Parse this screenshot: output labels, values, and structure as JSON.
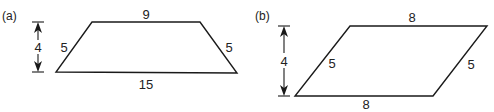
{
  "figures": [
    {
      "id": "a",
      "label": "(a)",
      "shape": "trapezoid",
      "sides": {
        "top": "9",
        "bottom": "15",
        "left": "5",
        "right": "5"
      },
      "height_label": "4"
    },
    {
      "id": "b",
      "label": "(b)",
      "shape": "parallelogram",
      "sides": {
        "top": "8",
        "bottom": "8",
        "left": "5",
        "right": "5"
      },
      "height_label": "4"
    }
  ],
  "colors": {
    "line": "#1a1a1a",
    "text": "#222222",
    "background": "#ffffff"
  }
}
